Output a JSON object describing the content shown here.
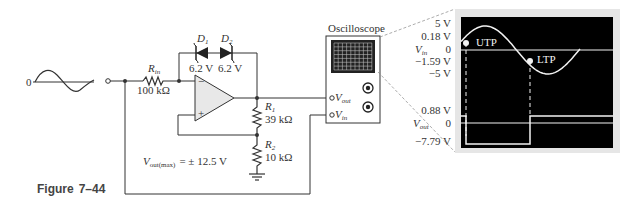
{
  "figure": {
    "label_prefix": "Figure",
    "label_number": "7–44"
  },
  "input_source": {
    "zero_label": "0"
  },
  "components": {
    "rin": {
      "name": "R",
      "sub": "in",
      "value": "100 kΩ"
    },
    "d1": {
      "name": "D",
      "sub": "1",
      "value": "6.2 V"
    },
    "d2": {
      "name": "D",
      "sub": "2",
      "value": "6.2 V"
    },
    "r1": {
      "name": "R",
      "sub": "1",
      "value": "39  kΩ"
    },
    "r2": {
      "name": "R",
      "sub": "2",
      "value": "10  kΩ"
    },
    "opamp": {
      "minus": "−",
      "plus": "+"
    },
    "vout_max": {
      "name": "V",
      "sub": "out(max)",
      "value": "= ± 12.5 V"
    }
  },
  "oscilloscope": {
    "title": "Oscilloscope",
    "inputs": [
      {
        "name": "V",
        "sub": "out"
      },
      {
        "name": "V",
        "sub": "in"
      }
    ]
  },
  "scope_display": {
    "vin_labels": {
      "top": "5 V",
      "utp": "0.18 V",
      "name": "V",
      "sub": "in",
      "zero": "0",
      "ltp": "−1.59 V",
      "bottom": "−5 V"
    },
    "vout_labels": {
      "high": "0.88 V",
      "name": "V",
      "sub": "out",
      "zero": "0",
      "low": "−7.79 V"
    },
    "markers": {
      "utp": "UTP",
      "ltp": "LTP"
    },
    "colors": {
      "screen": "#000000",
      "trace": "#f2f2f2",
      "bezel": "#e6e6e6"
    }
  }
}
